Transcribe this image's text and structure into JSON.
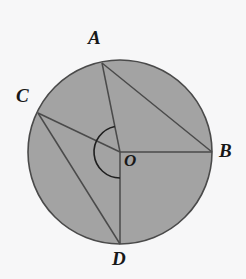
{
  "figure": {
    "type": "geometry-diagram",
    "canvas": {
      "width": 246,
      "height": 279
    },
    "colors": {
      "background": "#f7f7f8",
      "disk_fill": "#a3a3a3",
      "stroke": "#4a4a4a",
      "label_text": "#181818"
    },
    "circle": {
      "name": "circle-O",
      "center": {
        "x": 120,
        "y": 152
      },
      "radius": 92,
      "stroke_width": 1.6
    },
    "points": [
      {
        "id": "A",
        "label": "A",
        "x": 102,
        "y": 63,
        "label_x": 88,
        "label_y": 28
      },
      {
        "id": "B",
        "label": "B",
        "x": 212,
        "y": 152,
        "label_x": 219,
        "label_y": 141
      },
      {
        "id": "C",
        "label": "C",
        "x": 38,
        "y": 113,
        "label_x": 16,
        "label_y": 86
      },
      {
        "id": "D",
        "label": "D",
        "x": 120,
        "y": 244,
        "label_x": 112,
        "label_y": 249
      },
      {
        "id": "O",
        "label": "O",
        "x": 120,
        "y": 152,
        "label_x": 124,
        "label_y": 152
      }
    ],
    "segments": [
      {
        "name": "radius-OA",
        "from": "O",
        "to": "A"
      },
      {
        "name": "radius-OB",
        "from": "O",
        "to": "B"
      },
      {
        "name": "radius-OC",
        "from": "O",
        "to": "C"
      },
      {
        "name": "radius-OD",
        "from": "O",
        "to": "D"
      },
      {
        "name": "chord-AB",
        "from": "A",
        "to": "B"
      },
      {
        "name": "chord-CD",
        "from": "C",
        "to": "D"
      }
    ],
    "angle_arc": {
      "name": "central-angle-arc",
      "vertex": "O",
      "from_ray": "OA",
      "to_ray": "OD",
      "sweep": "counterclockwise-through-C",
      "radius": 26,
      "stroke_width": 1.6
    }
  }
}
